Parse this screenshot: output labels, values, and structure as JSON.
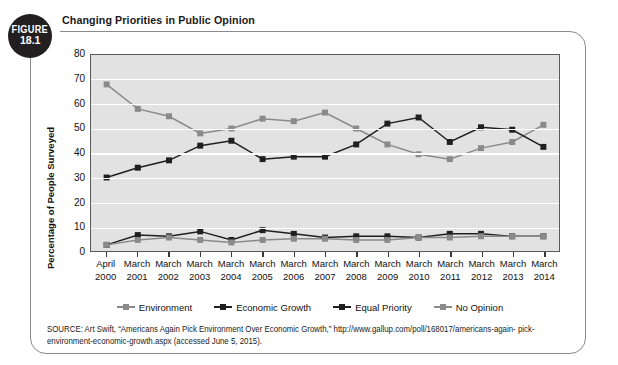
{
  "figure": {
    "badge_word": "FIGURE",
    "badge_number": "18.1",
    "title": "Changing Priorities in Public Opinion"
  },
  "source": {
    "line1": "SOURCE: Art Swift, “Americans Again Pick Environment Over Economic Growth,” http://www.gallup.com/poll/168017/americans-again-",
    "line2": "pick-environment-economic-growth.aspx (accessed June 5, 2015)."
  },
  "legend": {
    "position": "bottom-center",
    "items": [
      {
        "label": "Environment",
        "color": "#8a8a8a"
      },
      {
        "label": "Economic Growth",
        "color": "#1f1f1f"
      },
      {
        "label": "Equal Priority",
        "color": "#1f1f1f"
      },
      {
        "label": "No Opinion",
        "color": "#8a8a8a"
      }
    ]
  },
  "axes": {
    "ylabel": "Percentage of People Surveyed",
    "yticks": [
      "0",
      "10",
      "20",
      "30",
      "40",
      "50",
      "60",
      "70",
      "80"
    ],
    "xlabels": [
      {
        "top": "April",
        "bottom": "2000"
      },
      {
        "top": "March",
        "bottom": "2001"
      },
      {
        "top": "March",
        "bottom": "2002"
      },
      {
        "top": "March",
        "bottom": "2003"
      },
      {
        "top": "March",
        "bottom": "2004"
      },
      {
        "top": "March",
        "bottom": "2005"
      },
      {
        "top": "March",
        "bottom": "2006"
      },
      {
        "top": "March",
        "bottom": "2007"
      },
      {
        "top": "March",
        "bottom": "2008"
      },
      {
        "top": "March",
        "bottom": "2009"
      },
      {
        "top": "March",
        "bottom": "2010"
      },
      {
        "top": "March",
        "bottom": "2011"
      },
      {
        "top": "March",
        "bottom": "2012"
      },
      {
        "top": "March",
        "bottom": "2013"
      },
      {
        "top": "March",
        "bottom": "2014"
      }
    ]
  },
  "chart_data": {
    "type": "line",
    "title": "Changing Priorities in Public Opinion",
    "xlabel": "",
    "ylabel": "Percentage of People Surveyed",
    "ylim": [
      0,
      80
    ],
    "ytick_step": 10,
    "grid": true,
    "legend_position": "bottom-center",
    "categories": [
      "April 2000",
      "March 2001",
      "March 2002",
      "March 2003",
      "March 2004",
      "March 2005",
      "March 2006",
      "March 2007",
      "March 2008",
      "March 2009",
      "March 2010",
      "March 2011",
      "March 2012",
      "March 2013",
      "March 2014"
    ],
    "series": [
      {
        "name": "Environment",
        "color": "#8a8a8a",
        "values": [
          68,
          58,
          55,
          48,
          50,
          54,
          53,
          56.5,
          50,
          43.5,
          39.5,
          37.5,
          42,
          44.5,
          51.5
        ]
      },
      {
        "name": "Economic Growth",
        "color": "#1f1f1f",
        "values": [
          30,
          34,
          37,
          43,
          45,
          37.5,
          38.5,
          38.5,
          43.5,
          52,
          54.5,
          44.5,
          50.5,
          49.5,
          42.5
        ]
      },
      {
        "name": "Equal Priority",
        "color": "#1f1f1f",
        "values": [
          2.5,
          6.5,
          6,
          8,
          4.5,
          8.5,
          7,
          5.5,
          6,
          6,
          5.5,
          7,
          7,
          6,
          6
        ]
      },
      {
        "name": "No Opinion",
        "color": "#8a8a8a",
        "values": [
          2.5,
          4.5,
          5.5,
          4.5,
          3.5,
          4.5,
          5,
          5,
          4.5,
          4.5,
          5.5,
          5.5,
          6,
          6,
          6
        ]
      }
    ]
  }
}
